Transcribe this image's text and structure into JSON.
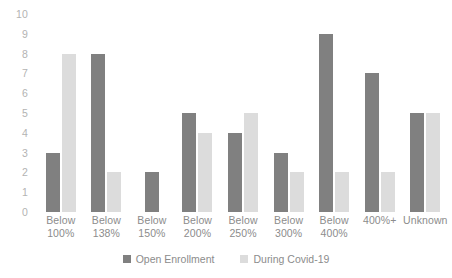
{
  "chart_data": {
    "type": "bar",
    "title": "",
    "xlabel": "",
    "ylabel": "",
    "ylim": [
      0,
      10
    ],
    "yticks": [
      "0",
      "1",
      "2",
      "3",
      "4",
      "5",
      "6",
      "7",
      "8",
      "9",
      "10"
    ],
    "grid": false,
    "legend_position": "bottom-center",
    "categories": [
      "Below\n100%",
      "Below\n138%",
      "Below\n150%",
      "Below\n200%",
      "Below\n250%",
      "Below\n300%",
      "Below\n400%",
      "400%+",
      "Unknown"
    ],
    "series": [
      {
        "name": "Open Enrollment",
        "color": "#808080",
        "values": [
          3,
          8,
          2,
          5,
          4,
          3,
          9,
          7,
          5
        ]
      },
      {
        "name": "During Covid-19",
        "color": "#dcdcdc",
        "values": [
          8,
          2,
          0,
          4,
          5,
          2,
          2,
          2,
          5
        ]
      }
    ]
  },
  "axis": {
    "tick_color": "#b3b3b3",
    "label_color": "#8c8c8c"
  }
}
